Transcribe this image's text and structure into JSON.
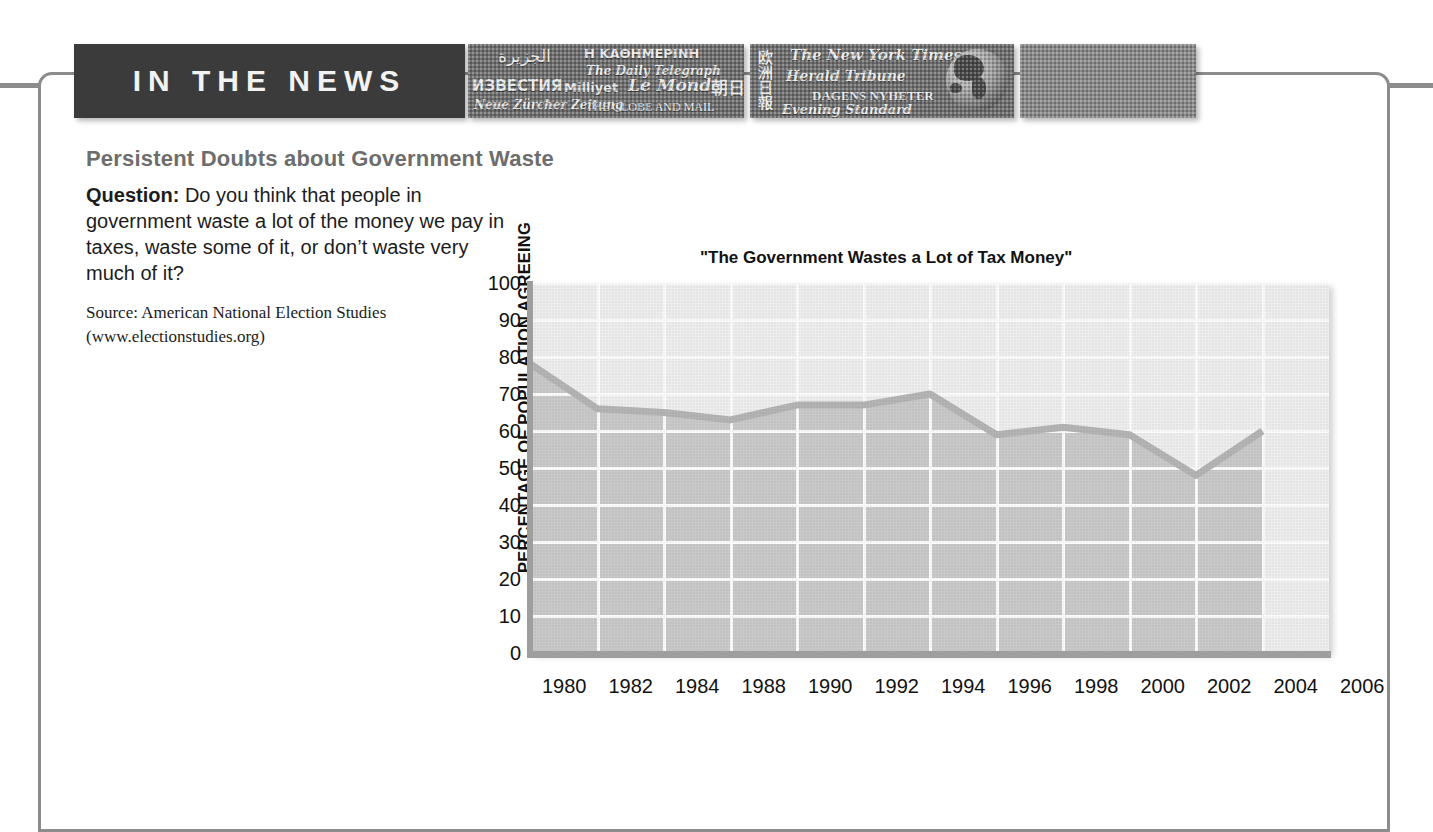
{
  "banner": {
    "title": "IN THE NEWS",
    "photo_1_mastheads": [
      "الجزيرة",
      "Η ΚΑΘΗΜΕΡΙΝΗ",
      "The Daily Telegraph",
      "ИЗВЕСТИЯ",
      "Milliyet",
      "Le Monde",
      "Neue Zürcher Zeitung",
      "THE GLOBE AND MAIL",
      "朝日"
    ],
    "photo_2_mastheads": [
      "欧洲日報",
      "The New York Times",
      "Herald Tribune",
      "DAGENS NYHETER",
      "Evening Standard"
    ],
    "globe_label": "globe"
  },
  "article": {
    "headline": "Persistent Doubts about Government Waste",
    "question_label": "Question:",
    "question_text": " Do you think that people in government waste a lot of the money we pay in taxes, waste some of it, or don’t waste very much of it?",
    "source_line_1": "Source: American National Election Studies",
    "source_line_2": "(www.electionstudies.org)"
  },
  "chart_data": {
    "type": "area",
    "title": "\"The Government Wastes a Lot of Tax Money\"",
    "xlabel": "",
    "ylabel": "PERCENTAGE OF POPULATION AGREEING",
    "ylim": [
      0,
      100
    ],
    "ytick_values": [
      0,
      10,
      20,
      30,
      40,
      50,
      60,
      70,
      80,
      90,
      100
    ],
    "ytick_labels": [
      "0",
      "10",
      "20",
      "30",
      "40",
      "50",
      "60",
      "70",
      "80",
      "90",
      "100"
    ],
    "categories": [
      "1980",
      "1982",
      "1984",
      "1988",
      "1990",
      "1992",
      "1994",
      "1996",
      "1998",
      "2000",
      "2002",
      "2004",
      "2006"
    ],
    "values": [
      78,
      66,
      65,
      63,
      67,
      67,
      70,
      59,
      61,
      59,
      48,
      60,
      null
    ],
    "grid": true,
    "legend": "none",
    "line_color": "#b4b4b4",
    "fill_color": "#c9c9c9",
    "plot_bg": "#ededed"
  },
  "colors": {
    "banner_bg": "#3b3b3b",
    "banner_text": "#f2f2f2",
    "frame_border": "#8c8c8c",
    "headline": "#6d6d6d",
    "body_text": "#1c1c1c"
  }
}
